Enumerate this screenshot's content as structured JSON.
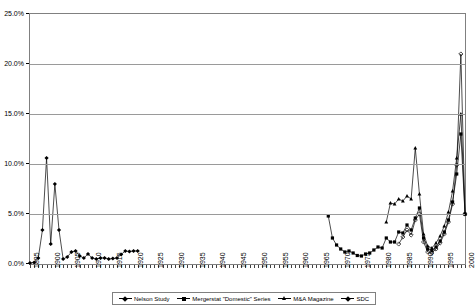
{
  "chart_data": {
    "type": "line",
    "title": "",
    "xlabel": "",
    "ylabel": "",
    "xlim": [
      1895,
      2000
    ],
    "ylim": [
      0,
      25
    ],
    "ytick_labels": [
      "0.0%",
      "5.0%",
      "10.0%",
      "15.0%",
      "20.0%",
      "25.0%"
    ],
    "ytick_values": [
      0,
      5,
      10,
      15,
      20,
      25
    ],
    "xtick_labels": [
      "1895",
      "1900",
      "1905",
      "1910",
      "1915",
      "1920",
      "1925",
      "1930",
      "1935",
      "1940",
      "1945",
      "1950",
      "1955",
      "1960",
      "1965",
      "1970",
      "1975",
      "1980",
      "1985",
      "1990",
      "1995",
      "2000"
    ],
    "xtick_values": [
      1895,
      1900,
      1905,
      1910,
      1915,
      1920,
      1925,
      1930,
      1935,
      1940,
      1945,
      1950,
      1955,
      1960,
      1965,
      1970,
      1975,
      1980,
      1985,
      1990,
      1995,
      2000
    ],
    "grid": true,
    "legend_position": "bottom",
    "series": [
      {
        "name": "Nelson Study",
        "marker": "diamond",
        "color": "#000000",
        "x": [
          1895,
          1896,
          1897,
          1898,
          1899,
          1900,
          1901,
          1902,
          1903,
          1904,
          1905,
          1906,
          1907,
          1908,
          1909,
          1910,
          1911,
          1912,
          1913,
          1914,
          1915,
          1916,
          1917,
          1918,
          1919,
          1920,
          1921
        ],
        "values": [
          0.1,
          0.15,
          0.6,
          3.4,
          10.6,
          2.0,
          8.0,
          3.4,
          0.5,
          0.7,
          1.2,
          1.3,
          0.8,
          0.6,
          1.0,
          0.6,
          0.5,
          0.6,
          0.6,
          0.5,
          0.55,
          0.6,
          0.95,
          1.3,
          1.25,
          1.3,
          1.3
        ]
      },
      {
        "name": "Mergerstat \"Domestic\" Series",
        "marker": "square",
        "color": "#000000",
        "x": [
          1967,
          1968,
          1969,
          1970,
          1971,
          1972,
          1973,
          1974,
          1975,
          1976,
          1977,
          1978,
          1979,
          1980,
          1981,
          1982,
          1983,
          1984,
          1985,
          1986,
          1987,
          1988,
          1989,
          1990,
          1991,
          1992,
          1993,
          1994,
          1995,
          1996,
          1997,
          1998,
          1999,
          2000
        ],
        "values": [
          4.8,
          2.6,
          1.9,
          1.5,
          1.2,
          1.3,
          1.1,
          0.85,
          0.8,
          1.0,
          1.1,
          1.4,
          1.7,
          1.6,
          2.6,
          2.2,
          2.2,
          3.2,
          3.1,
          3.9,
          3.4,
          4.6,
          5.6,
          2.6,
          1.5,
          1.35,
          1.7,
          2.3,
          3.2,
          4.4,
          6.2,
          9.0,
          13.0,
          5.0
        ]
      },
      {
        "name": "M&A Magazine",
        "marker": "triangle",
        "color": "#000000",
        "x": [
          1981,
          1982,
          1983,
          1984,
          1985,
          1986,
          1987,
          1988,
          1989,
          1990,
          1991,
          1992,
          1993,
          1994,
          1995,
          1996,
          1997,
          1998,
          1999,
          2000
        ],
        "values": [
          4.2,
          6.1,
          6.0,
          6.5,
          6.3,
          6.8,
          6.5,
          11.6,
          7.0,
          3.0,
          1.8,
          1.6,
          2.1,
          2.8,
          3.8,
          5.2,
          7.3,
          10.6,
          15.0,
          5.0
        ]
      },
      {
        "name": "SDC",
        "marker": "diamond-open",
        "color": "#000000",
        "x": [
          1984,
          1985,
          1986,
          1987,
          1988,
          1989,
          1990,
          1991,
          1992,
          1993,
          1994,
          1995,
          1996,
          1997,
          1998,
          1999,
          2000
        ],
        "values": [
          2.0,
          2.7,
          3.4,
          2.9,
          4.4,
          5.0,
          2.2,
          1.2,
          1.1,
          1.5,
          2.1,
          3.0,
          4.2,
          6.0,
          9.9,
          21.0,
          5.0
        ]
      }
    ]
  },
  "legend": {
    "items": [
      {
        "label": "Nelson Study",
        "marker": "diamond"
      },
      {
        "label": "Mergerstat \"Domestic\" Series",
        "marker": "square"
      },
      {
        "label": "M&A Magazine",
        "marker": "triangle"
      },
      {
        "label": "SDC",
        "marker": "diamond-open"
      }
    ]
  }
}
